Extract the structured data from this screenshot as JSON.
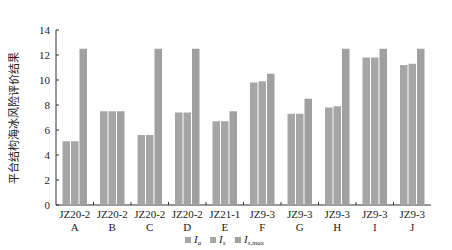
{
  "chart_data": {
    "type": "bar",
    "title": "",
    "xlabel": "",
    "ylabel": "平台结构海冰风险评价结果",
    "ylim": [
      0,
      14
    ],
    "yticks": [
      0,
      2,
      4,
      6,
      8,
      10,
      12,
      14
    ],
    "grid": false,
    "legend_position": "bottom",
    "categories": [
      {
        "top": "JZ20-2",
        "bottom": "A"
      },
      {
        "top": "JZ20-2",
        "bottom": "B"
      },
      {
        "top": "JZ20-2",
        "bottom": "C"
      },
      {
        "top": "JZ20-2",
        "bottom": "D"
      },
      {
        "top": "JZ21-1",
        "bottom": "E"
      },
      {
        "top": "JZ9-3",
        "bottom": "F"
      },
      {
        "top": "JZ9-3",
        "bottom": "G"
      },
      {
        "top": "JZ9-3",
        "bottom": "H"
      },
      {
        "top": "JZ9-3",
        "bottom": "I"
      },
      {
        "top": "JZ9-3",
        "bottom": "J"
      }
    ],
    "series": [
      {
        "name": "I_a",
        "label": "I",
        "sub": "a",
        "color": "#a6a6a6",
        "values": [
          5.1,
          7.5,
          5.6,
          7.4,
          6.7,
          9.8,
          7.3,
          7.8,
          11.8,
          11.2
        ]
      },
      {
        "name": "I_s",
        "label": "I",
        "sub": "s",
        "color": "#a6a6a6",
        "values": [
          5.1,
          7.5,
          5.6,
          7.4,
          6.7,
          9.9,
          7.3,
          7.9,
          11.8,
          11.3
        ]
      },
      {
        "name": "I_s,max",
        "label": "I",
        "sub": "s,max",
        "color": "#a0a0a0",
        "values": [
          12.5,
          7.5,
          12.5,
          12.5,
          7.5,
          10.5,
          8.5,
          12.5,
          12.5,
          12.5
        ]
      }
    ]
  }
}
